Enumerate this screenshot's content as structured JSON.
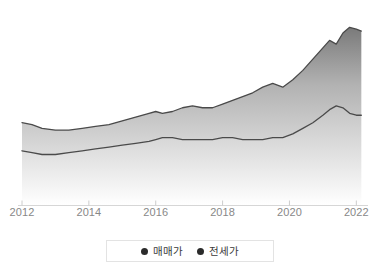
{
  "chart_data": {
    "type": "area",
    "title": "",
    "subtitle": "",
    "xlabel": "",
    "ylabel": "",
    "grid": false,
    "legend_position": "bottom",
    "xlim": [
      2012,
      2022.2
    ],
    "ylim": [
      0,
      100
    ],
    "x_ticks": [
      "2012",
      "2014",
      "2016",
      "2018",
      "2020",
      "2022"
    ],
    "x_tick_values": [
      2012,
      2014,
      2016,
      2018,
      2020,
      2022
    ],
    "x": [
      2012.0,
      2012.3,
      2012.6,
      2013.0,
      2013.4,
      2013.8,
      2014.2,
      2014.6,
      2015.0,
      2015.4,
      2015.8,
      2016.0,
      2016.2,
      2016.5,
      2016.8,
      2017.1,
      2017.4,
      2017.7,
      2018.0,
      2018.3,
      2018.6,
      2018.9,
      2019.2,
      2019.5,
      2019.8,
      2020.1,
      2020.4,
      2020.7,
      2021.0,
      2021.2,
      2021.4,
      2021.6,
      2021.8,
      2022.0,
      2022.15
    ],
    "series": [
      {
        "name": "매매가",
        "color": "#6f6f6f",
        "values": [
          44,
          43,
          41,
          40,
          40,
          41,
          42,
          43,
          45,
          47,
          49,
          50,
          49,
          50,
          52,
          53,
          52,
          52,
          54,
          56,
          58,
          60,
          63,
          65,
          63,
          67,
          72,
          78,
          84,
          88,
          86,
          92,
          95,
          94,
          93
        ]
      },
      {
        "name": "전세가",
        "color": "#6f6f6f",
        "values": [
          29,
          28,
          27,
          27,
          28,
          29,
          30,
          31,
          32,
          33,
          34,
          35,
          36,
          36,
          35,
          35,
          35,
          35,
          36,
          36,
          35,
          35,
          35,
          36,
          36,
          38,
          41,
          44,
          48,
          51,
          53,
          52,
          49,
          48,
          48
        ]
      }
    ]
  },
  "legend": {
    "items": [
      {
        "label": "매매가",
        "color": "#2b2b2b"
      },
      {
        "label": "전세가",
        "color": "#2b2b2b"
      }
    ]
  },
  "axis": {
    "line_color": "#d6d6d6",
    "tick_color": "#cccccc",
    "label_color": "#888888"
  },
  "colors": {
    "upper_band_top": "#7c7c7c",
    "upper_band_bottom": "#e0e0e0",
    "lower_band_top": "#c9c9c9",
    "lower_band_bottom": "#ffffff",
    "stroke": "#4a4a4a",
    "background": "#ffffff"
  }
}
